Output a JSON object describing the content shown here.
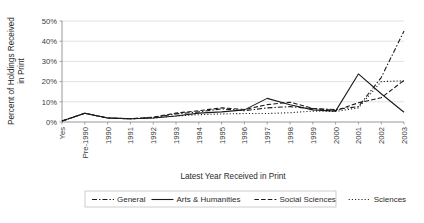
{
  "chart_data": {
    "type": "line",
    "title": "",
    "xlabel": "Latest Year Received in Print",
    "ylabel": "Percent of Holdings Received in Print",
    "categories": [
      "Yes",
      "Pre-1990",
      "1990",
      "1991",
      "1992",
      "1993",
      "1994",
      "1995",
      "1996",
      "1997",
      "1998",
      "1999",
      "2000",
      "2001",
      "2002",
      "2003"
    ],
    "ytick_labels": [
      "0%",
      "10%",
      "20%",
      "30%",
      "40%",
      "50%"
    ],
    "ytick_values": [
      0,
      10,
      20,
      30,
      40,
      50
    ],
    "ylim": [
      0,
      50
    ],
    "grid": true,
    "legend_position": "bottom",
    "series": [
      {
        "name": "General",
        "dash": "dash-dot",
        "dasharray": "5,2,1.4,2",
        "values": [
          0.5,
          4.3,
          2.0,
          1.6,
          2.2,
          4.0,
          5.0,
          6.5,
          5.6,
          7.0,
          7.6,
          6.6,
          6.2,
          7.6,
          22.0,
          45.0
        ]
      },
      {
        "name": "Arts & Humanities",
        "dash": "solid",
        "dasharray": "",
        "values": [
          0.5,
          4.3,
          2.0,
          1.6,
          2.0,
          3.0,
          4.4,
          5.0,
          6.0,
          11.7,
          8.5,
          6.0,
          5.4,
          23.8,
          14.0,
          4.8
        ]
      },
      {
        "name": "Social Sciences",
        "dash": "dashed",
        "dasharray": "4.5,2.2",
        "values": [
          0.5,
          4.3,
          2.0,
          1.6,
          2.4,
          4.4,
          5.6,
          7.0,
          6.2,
          8.6,
          9.8,
          6.8,
          5.6,
          9.5,
          12.0,
          20.6
        ]
      },
      {
        "name": "Sciences",
        "dash": "dotted",
        "dasharray": "1.1,2.1",
        "values": [
          0.5,
          4.3,
          2.0,
          1.6,
          2.0,
          3.0,
          3.6,
          4.0,
          4.2,
          4.2,
          4.6,
          5.4,
          5.2,
          7.0,
          20.0,
          20.4
        ]
      }
    ]
  },
  "colors": {
    "line": "#1a1a1a",
    "grid": "#d4d4d4",
    "axis": "#7d7d7d",
    "text": "#2b2b2b",
    "background": "#ffffff"
  }
}
